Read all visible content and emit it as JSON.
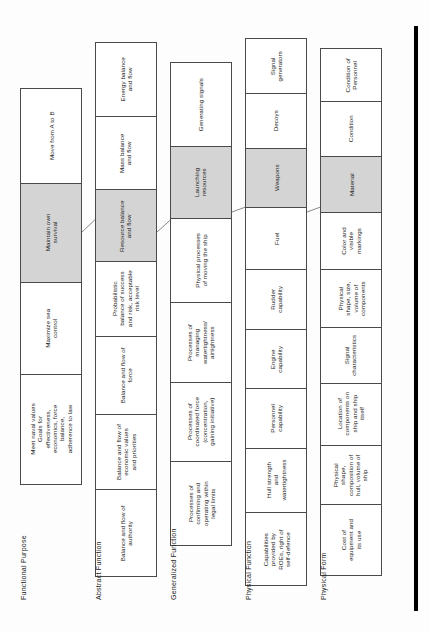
{
  "diagram": {
    "orientation": "rotated-90-ccw",
    "shaded_color": "#d4d4d4",
    "box_border_color": "#4a4a4a",
    "levels": [
      {
        "caption": "Functional Purpose",
        "boxes": [
          {
            "label": "Meet naval values\nGoals for effectiveness,\neconomics, force balance,\nadherence to law",
            "shaded": false
          },
          {
            "label": "Maximize sea control",
            "shaded": false
          },
          {
            "label": "Maintain own survival",
            "shaded": true
          },
          {
            "label": "Move from A to B",
            "shaded": false
          }
        ]
      },
      {
        "caption": "Abstract Function",
        "boxes": [
          {
            "label": "Balance and flow of\nauthority",
            "shaded": false
          },
          {
            "label": "Balance and flow of\neconomic values\nand priorities",
            "shaded": false
          },
          {
            "label": "Balance and flow of\nforce",
            "shaded": false
          },
          {
            "label": "Probabilistic\nbalance of success\nand risk, acceptable\nrisk level",
            "shaded": false
          },
          {
            "label": "Resource balance\nand flow",
            "shaded": true
          },
          {
            "label": "Mass balance\nand flow",
            "shaded": false
          },
          {
            "label": "Energy balance\nand flow",
            "shaded": false
          }
        ]
      },
      {
        "caption": "Generalized Function",
        "boxes": [
          {
            "label": "Processes of\nconfirming and\noperating within\nlegal limits",
            "shaded": false
          },
          {
            "label": "Processes of\ncoordinated force\n(concentration,\ngaining initiative)",
            "shaded": false
          },
          {
            "label": "Processes of\nmanaging\nwatertightness/\nairtightness",
            "shaded": false
          },
          {
            "label": "Physical processes\nof moving the ship",
            "shaded": false
          },
          {
            "label": "Launching\nresources",
            "shaded": true
          },
          {
            "label": "Generating signals",
            "shaded": false
          }
        ]
      },
      {
        "caption": "Physical Function",
        "boxes": [
          {
            "label": "Capabilities\nprovided by\nROEs, right of\nself-defence",
            "shaded": false
          },
          {
            "label": "Hull strength\nand\nwatertightness",
            "shaded": false
          },
          {
            "label": "Personnel\ncapability",
            "shaded": false
          },
          {
            "label": "Engine\ncapability",
            "shaded": false
          },
          {
            "label": "Rudder\ncapability",
            "shaded": false
          },
          {
            "label": "Fuel",
            "shaded": false
          },
          {
            "label": "Weapons",
            "shaded": true
          },
          {
            "label": "Decoys",
            "shaded": false
          },
          {
            "label": "Signal\ngenerators",
            "shaded": false
          }
        ]
      },
      {
        "caption": "Physical Form",
        "boxes": [
          {
            "label": "Cost of\nequipment and\nits use",
            "shaded": false
          },
          {
            "label": "Physical\nshape,\ncomposition of\nhull, volume of\nship",
            "shaded": false
          },
          {
            "label": "Location of\ncomponents on\nship and ship\nitself",
            "shaded": false
          },
          {
            "label": "Signal\ncharacteristics",
            "shaded": false
          },
          {
            "label": "Physical\nshape, size,\nvolume of\ncomponents",
            "shaded": false
          },
          {
            "label": "Color and\nvisible\nmarkings",
            "shaded": false
          },
          {
            "label": "Material",
            "shaded": true
          },
          {
            "label": "Condition",
            "shaded": false
          },
          {
            "label": "Condition of\nPersonnel",
            "shaded": false
          }
        ]
      }
    ],
    "links": [
      {
        "from": "Maintain own survival",
        "to": "Resource balance and flow"
      },
      {
        "from": "Resource balance and flow",
        "to": "Launching resources"
      },
      {
        "from": "Launching resources",
        "to": "Weapons"
      },
      {
        "from": "Weapons",
        "to": "Material"
      }
    ]
  }
}
